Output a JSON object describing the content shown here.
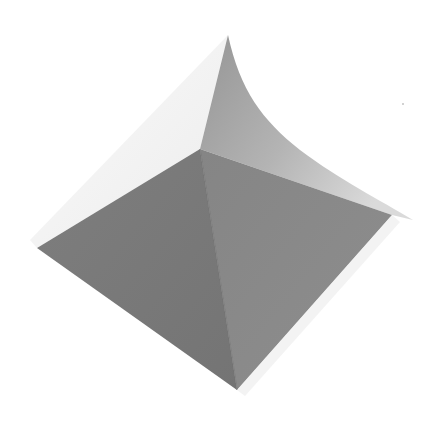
{
  "image": {
    "subject": "Folded paper pyramid",
    "description": "Grayscale photo of a folded paper square pyramid with one corner curling upward into a pointed tip",
    "background_color": "#ffffff"
  },
  "colors": {
    "left_face": "#7b7b7b",
    "right_face": "#8a8a8a",
    "back_face_dark": "#979797",
    "back_face_light": "#d2d2d2",
    "left_flap": "#f4f4f4",
    "crease": "#6e6e6e"
  }
}
